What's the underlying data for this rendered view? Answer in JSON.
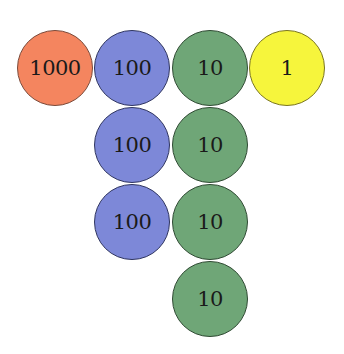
{
  "diagram": {
    "title": "",
    "chips": [
      {
        "id": "chip-1000-r1",
        "label": "1000",
        "value": 1000,
        "color": "#F4855F",
        "col": 0,
        "row": 0
      },
      {
        "id": "chip-100-r1",
        "label": "100",
        "value": 100,
        "color": "#7D88D8",
        "col": 1,
        "row": 0
      },
      {
        "id": "chip-10-r1",
        "label": "10",
        "value": 10,
        "color": "#6FA677",
        "col": 2,
        "row": 0
      },
      {
        "id": "chip-1-r1",
        "label": "1",
        "value": 1,
        "color": "#F6F53C",
        "col": 3,
        "row": 0
      },
      {
        "id": "chip-100-r2",
        "label": "100",
        "value": 100,
        "color": "#7D88D8",
        "col": 1,
        "row": 1
      },
      {
        "id": "chip-10-r2",
        "label": "10",
        "value": 10,
        "color": "#6FA677",
        "col": 2,
        "row": 1
      },
      {
        "id": "chip-100-r3",
        "label": "100",
        "value": 100,
        "color": "#7D88D8",
        "col": 1,
        "row": 2
      },
      {
        "id": "chip-10-r3",
        "label": "10",
        "value": 10,
        "color": "#6FA677",
        "col": 2,
        "row": 2
      },
      {
        "id": "chip-10-r4",
        "label": "10",
        "value": 10,
        "color": "#6FA677",
        "col": 2,
        "row": 3
      }
    ],
    "columns": [
      {
        "place": "thousands",
        "count": 1
      },
      {
        "place": "hundreds",
        "count": 3
      },
      {
        "place": "tens",
        "count": 4
      },
      {
        "place": "ones",
        "count": 1
      }
    ]
  }
}
